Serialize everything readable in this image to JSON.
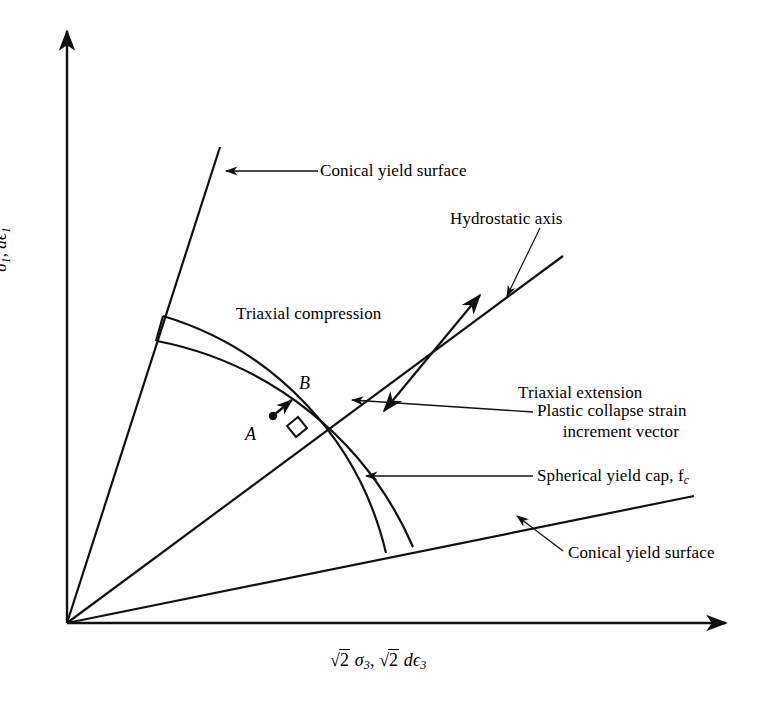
{
  "figure": {
    "type": "engineering-diagram"
  },
  "axes": {
    "y_label_parts": {
      "sigma": "σ",
      "sigma_sub": "1",
      "sep": ", ",
      "d_eps": "dϵ",
      "d_eps_sub": "1"
    },
    "y_label_text": "σ₁, dϵ₁",
    "x_label_text": "√2 σ₃, √2 dϵ₃",
    "x_label_parts": {
      "radical1": "2",
      "sigma": "σ",
      "sigma_sub": "3",
      "sep": ", ",
      "radical2": "2",
      "d_eps": "dϵ",
      "d_eps_sub": "3"
    }
  },
  "labels": {
    "conical_yield_surface_top": "Conical yield surface",
    "conical_yield_surface_bottom": "Conical yield surface",
    "hydrostatic_axis": "Hydrostatic axis",
    "triaxial_compression": "Triaxial compression",
    "triaxial_extension": "Triaxial extension",
    "plastic_collapse_line1": "Plastic collapse strain",
    "plastic_collapse_line2": "increment vector",
    "spherical_yield_cap_text": "Spherical yield cap, f",
    "spherical_yield_cap_sub": "c",
    "point_a": "A",
    "point_b": "B"
  },
  "style": {
    "stroke": "#111111",
    "background": "#ffffff",
    "axis_width": 2.4,
    "surface_width": 2.2,
    "leader_width": 1.2
  },
  "geometry": {
    "origin": {
      "x": 67,
      "y": 623
    },
    "y_axis_top": {
      "x": 67,
      "y": 25
    },
    "x_axis_right": {
      "x": 732,
      "y": 623
    },
    "conical_top_line": {
      "x1": 67,
      "y1": 623,
      "x2": 220,
      "y2": 147
    },
    "conical_bottom_line": {
      "x1": 67,
      "y1": 623,
      "x2": 694,
      "y2": 496
    },
    "hydrostatic_line": {
      "x1": 67,
      "y1": 623,
      "x2": 563,
      "y2": 256
    },
    "cap_inner_radius": 325,
    "cap_outer_radius": 352
  }
}
